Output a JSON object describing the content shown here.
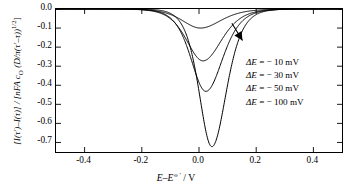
{
  "chart_data": {
    "type": "line",
    "title": "",
    "xlabel_parts": {
      "italic1": "E–E",
      "sup": "⦵′",
      "unit": " / V"
    },
    "ylabel_parts": {
      "num": "[I(τ′)–I(τ)]",
      "den": "[nFA c_O (D/π(τ′–τ))^{1/2}]"
    },
    "xlim": [
      -0.5,
      0.5
    ],
    "ylim": [
      -0.75,
      0.0
    ],
    "xticks": [
      -0.4,
      -0.2,
      0.0,
      0.2,
      0.4
    ],
    "xticklabels": [
      "-0.4",
      "-0.2",
      "0.0",
      "0.2",
      "0.4"
    ],
    "yticks": [
      0.0,
      -0.1,
      -0.2,
      -0.3,
      -0.4,
      -0.5,
      -0.6,
      -0.7
    ],
    "yticklabels": [
      "0.0",
      "-0.1",
      "-0.2",
      "-0.3",
      "-0.4",
      "-0.5",
      "-0.6",
      "-0.7"
    ],
    "grid": false,
    "legend_position": "inside-right",
    "annotation": {
      "type": "arrow",
      "direction": "down-right",
      "meaning": "increasing |ΔE|"
    },
    "series": [
      {
        "name": "ΔE = − 10 mV",
        "delta_E_mV": -10,
        "peak_x": 0.005,
        "peak_y": -0.1,
        "half_width": 0.0905,
        "color": "#000000"
      },
      {
        "name": "ΔE = − 30 mV",
        "delta_E_mV": -30,
        "peak_x": 0.014,
        "peak_y": -0.272,
        "half_width": 0.082,
        "color": "#000000"
      },
      {
        "name": "ΔE = − 50 mV",
        "delta_E_mV": -50,
        "peak_x": 0.024,
        "peak_y": -0.432,
        "half_width": 0.0745,
        "color": "#000000"
      },
      {
        "name": "ΔE = − 100 mV",
        "delta_E_mV": -100,
        "peak_x": 0.045,
        "peak_y": -0.722,
        "half_width": 0.064,
        "color": "#000000"
      }
    ],
    "sampled_points": {
      "x": [
        -0.5,
        -0.45,
        -0.4,
        -0.35,
        -0.3,
        -0.25,
        -0.2,
        -0.15,
        -0.12,
        -0.1,
        -0.08,
        -0.06,
        -0.04,
        -0.02,
        0.0,
        0.02,
        0.04,
        0.06,
        0.08,
        0.1,
        0.12,
        0.15,
        0.2,
        0.25,
        0.3,
        0.35,
        0.4,
        0.45,
        0.5
      ],
      "y_10mV": [
        0.0,
        0.0,
        0.0,
        0.0,
        0.0,
        -0.001,
        -0.002,
        -0.008,
        -0.016,
        -0.026,
        -0.041,
        -0.062,
        -0.082,
        -0.096,
        -0.1,
        -0.094,
        -0.079,
        -0.059,
        -0.039,
        -0.024,
        -0.014,
        -0.006,
        -0.001,
        0.0,
        0.0,
        0.0,
        0.0,
        0.0,
        0.0
      ],
      "y_30mV": [
        0.0,
        0.0,
        0.0,
        0.0,
        -0.001,
        -0.002,
        -0.007,
        -0.023,
        -0.045,
        -0.07,
        -0.108,
        -0.156,
        -0.206,
        -0.248,
        -0.268,
        -0.272,
        -0.256,
        -0.215,
        -0.163,
        -0.112,
        -0.071,
        -0.032,
        -0.005,
        -0.001,
        0.0,
        0.0,
        0.0,
        0.0,
        0.0
      ],
      "y_50mV": [
        0.0,
        0.0,
        0.0,
        0.0,
        -0.001,
        -0.004,
        -0.012,
        -0.037,
        -0.07,
        -0.108,
        -0.163,
        -0.234,
        -0.307,
        -0.376,
        -0.415,
        -0.432,
        -0.424,
        -0.379,
        -0.303,
        -0.216,
        -0.141,
        -0.066,
        -0.011,
        -0.001,
        0.0,
        0.0,
        0.0,
        0.0,
        0.0
      ],
      "y_100mV": [
        0.0,
        0.0,
        0.0,
        -0.001,
        -0.002,
        -0.006,
        -0.019,
        -0.056,
        -0.103,
        -0.155,
        -0.23,
        -0.327,
        -0.432,
        -0.541,
        -0.628,
        -0.692,
        -0.722,
        -0.7,
        -0.608,
        -0.461,
        -0.313,
        -0.152,
        -0.026,
        -0.003,
        0.0,
        0.0,
        0.0,
        0.0,
        0.0
      ]
    }
  },
  "legend": {
    "items": [
      {
        "label_head": "ΔE",
        "label_tail": " = − 10 mV"
      },
      {
        "label_head": "ΔE",
        "label_tail": " = − 30 mV"
      },
      {
        "label_head": "ΔE",
        "label_tail": " = − 50 mV"
      },
      {
        "label_head": "ΔE",
        "label_tail": " = − 100 mV"
      }
    ]
  },
  "axes": {
    "x_label_italic": "E–E",
    "x_label_sup": "⦵′",
    "x_label_unit": " / V",
    "y_label_numerator": "[I(τ′)–I(τ)] / [",
    "y_label_mid": "nFA c",
    "y_label_sub": "O",
    "y_label_rest": " (D/π(τ′–τ))",
    "y_label_sup": "1/2",
    "y_label_close": "]"
  }
}
